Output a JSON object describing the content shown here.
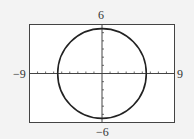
{
  "chart_data": {
    "type": "line",
    "title": "",
    "xlabel": "",
    "ylabel": "",
    "xlim": [
      -9,
      9
    ],
    "ylim": [
      -6,
      6
    ],
    "grid": false,
    "legend": null,
    "tick_labels": {
      "x_min": "-9",
      "x_max": "9",
      "y_max": "6",
      "y_min": "-6"
    },
    "x_tick_step": 1,
    "y_tick_step": 1,
    "series": [
      {
        "name": "circle",
        "shape": "circle",
        "center": [
          0,
          0
        ],
        "radius": 5.5,
        "color": "#222222"
      }
    ]
  },
  "labels": {
    "x_min": "−9",
    "x_max": "9",
    "y_max": "6",
    "y_min": "−6"
  },
  "colors": {
    "background": "#f3f3f3",
    "plot_background": "#ffffff",
    "frame": "#444444",
    "axis": "#444444",
    "curve": "#222222"
  }
}
